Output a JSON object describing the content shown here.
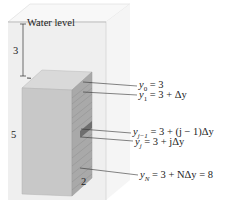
{
  "diagram": {
    "water_label": "Water level",
    "depth_label": "3",
    "height_label": "5",
    "width_label": "2",
    "equations": [
      {
        "lhs": "y",
        "sub": "0",
        "rhs": " = 3"
      },
      {
        "lhs": "y",
        "sub": "1",
        "rhs": " = 3 + Δy"
      },
      {
        "lhs": "y",
        "sub": "j−1",
        "rhs": " = 3 + (j − 1)Δy"
      },
      {
        "lhs": "y",
        "sub": "j",
        "rhs": " = 3 + jΔy"
      },
      {
        "lhs": "y",
        "sub": "N",
        "rhs": " = 3 + NΔy = 8"
      }
    ],
    "colors": {
      "tank_face": "#f0f0f0",
      "tank_top": "#f6f6f6",
      "block_front": "#c9c9c9",
      "block_top": "#dcdcdc",
      "block_side": "#a8a8a8",
      "strip_dark": "#6e6e6e"
    }
  }
}
